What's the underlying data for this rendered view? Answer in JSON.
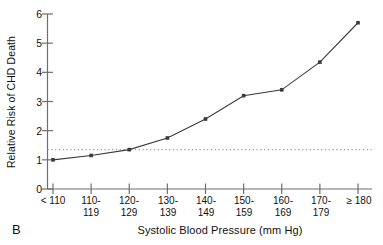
{
  "chart_data": {
    "type": "line",
    "title": "",
    "panel_label": "B",
    "xlabel": "Systolic Blood Pressure (mm Hg)",
    "ylabel": "Relative Risk of CHD Death",
    "categories": [
      "< 110",
      "110-\n119",
      "120-\n129",
      "130-\n139",
      "140-\n149",
      "150-\n159",
      "160-\n169",
      "170-\n179",
      "≥ 180"
    ],
    "values": [
      1.0,
      1.15,
      1.35,
      1.75,
      2.4,
      3.2,
      3.4,
      4.35,
      5.7
    ],
    "series": [
      {
        "name": "Relative Risk of CHD Death",
        "values": [
          1.0,
          1.15,
          1.35,
          1.75,
          2.4,
          3.2,
          3.4,
          4.35,
          5.7
        ]
      }
    ],
    "ylim": [
      0,
      6
    ],
    "yticks": [
      0,
      1,
      2,
      3,
      4,
      5,
      6
    ],
    "ytick_labels": [
      "0",
      "1",
      "2",
      "3",
      "4",
      "5",
      "6"
    ],
    "grid": false,
    "legend": "none",
    "marker": "square",
    "line_color": "#3a3a3a",
    "marker_color": "#3a3a3a",
    "axis_color": "#6e6e6e",
    "annotations": [
      {
        "type": "reference-line",
        "orientation": "horizontal",
        "value": 1.35,
        "style": "dotted",
        "color": "#9a9a9a"
      }
    ]
  }
}
